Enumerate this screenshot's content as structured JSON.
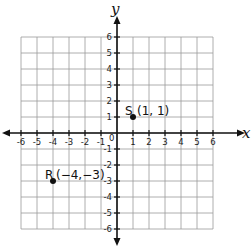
{
  "diagram": {
    "type": "coordinate-plane",
    "x_axis": {
      "label": "x",
      "min": -6,
      "max": 6,
      "ticks": [
        "-6",
        "-5",
        "-4",
        "-3",
        "-2",
        "-1",
        "1",
        "2",
        "3",
        "4",
        "5",
        "6"
      ]
    },
    "y_axis": {
      "label": "y",
      "min": -6,
      "max": 6,
      "ticks": [
        "6",
        "5",
        "4",
        "3",
        "2",
        "1",
        "-1",
        "-2",
        "-3",
        "-4",
        "-5",
        "-6"
      ]
    },
    "origin_label": "0",
    "grid": true,
    "points": [
      {
        "name": "S",
        "x": 1,
        "y": 1,
        "coord_text": "(1, 1)"
      },
      {
        "name": "R",
        "x": -4,
        "y": -3,
        "coord_text": "(−4,−3)"
      }
    ],
    "colors": {
      "axis": "#111111",
      "grid": "#9a9a9a",
      "point": "#111111",
      "background": "#ffffff"
    }
  }
}
